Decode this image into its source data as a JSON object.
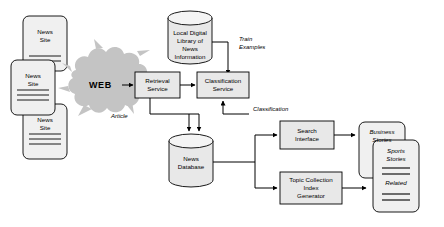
{
  "diagram": {
    "background_color": "#ffffff",
    "line_color": "#000000",
    "box_fill": "#e8e8e8",
    "cloud_fill": "#c4c4c4",
    "card_fill": "#f0f0f0"
  },
  "sources": {
    "cards": [
      {
        "label": "News\nSite",
        "rules": 0
      },
      {
        "label": "News\nSite",
        "rules": 3
      },
      {
        "label": "News\nSite",
        "rules": 3
      }
    ]
  },
  "web": {
    "label": "WEB"
  },
  "nodes": {
    "local_library": "Local Digital\nLibrary of\nNews\nInformation",
    "retrieval_service": "Retrieval\nService",
    "classification_service": "Classification\nService",
    "news_database": "News\nDatabase",
    "search_interface": "Search\nInterface",
    "topic_collection": "Topic Collection\nIndex\nGenerator"
  },
  "edge_labels": {
    "article": "Article",
    "train_examples": "Train\nExamples",
    "classification": "Classification"
  },
  "outputs": {
    "cards": [
      {
        "label": "Business\nStories",
        "rules": 0
      },
      {
        "label": "Sports\nStories",
        "secondary": "Related",
        "rules": 4
      }
    ]
  }
}
